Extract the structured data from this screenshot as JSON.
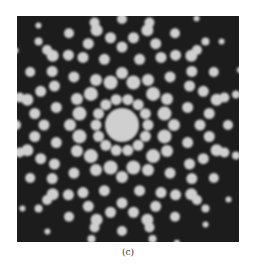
{
  "figure": {
    "caption": "(c)",
    "background": "#1c1c1c",
    "spot_color": "#cfcfcf",
    "center": {
      "x": 105,
      "y": 109
    },
    "central_disc_radius": 17,
    "rings": [
      {
        "radius": 26,
        "count": 14,
        "offset": 0,
        "spot_r": 5.5
      },
      {
        "radius": 44,
        "count": 12,
        "offset": 15,
        "spot_r": 7
      },
      {
        "radius": 52,
        "count": 12,
        "offset": 0,
        "spot_r": 6
      },
      {
        "radius": 68,
        "count": 12,
        "offset": 15,
        "spot_r": 5.5
      },
      {
        "radius": 78,
        "count": 12,
        "offset": 0,
        "spot_r": 5.5
      },
      {
        "radius": 88,
        "count": 24,
        "offset": 7.5,
        "spot_r": 5.5
      },
      {
        "radius": 98,
        "count": 12,
        "offset": 15,
        "spot_r": 6
      },
      {
        "radius": 106,
        "count": 24,
        "offset": 0,
        "spot_r": 5
      },
      {
        "radius": 118,
        "count": 12,
        "offset": 15,
        "spot_r": 4
      },
      {
        "radius": 130,
        "count": 24,
        "offset": 5,
        "spot_r": 3
      }
    ]
  }
}
